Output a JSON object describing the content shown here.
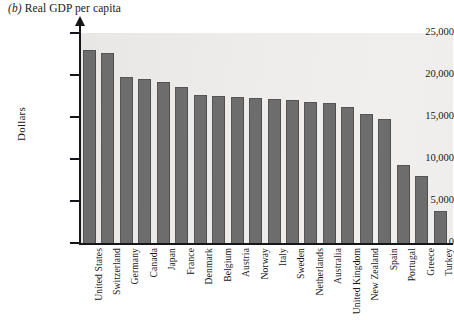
{
  "chart_data": {
    "type": "bar",
    "title": "(b) Real GDP per capita",
    "title_prefix": "(b)",
    "title_text": "Real GDP per capita",
    "xlabel": "",
    "ylabel": "Dollars",
    "ylim": [
      0,
      25000
    ],
    "ytick_labels": [
      "25,000",
      "20,000",
      "15,000",
      "10,000",
      "5,000",
      "0"
    ],
    "ytick_values": [
      25000,
      20000,
      15000,
      10000,
      5000,
      0
    ],
    "grid": false,
    "legend": null,
    "bar_color": "#6d6d6d",
    "plot_background": "#efedeb",
    "categories": [
      "United States",
      "Switzerland",
      "Germany",
      "Canada",
      "Japan",
      "France",
      "Denmark",
      "Belgium",
      "Austria",
      "Norway",
      "Italy",
      "Sweden",
      "Netherlands",
      "Australia",
      "United Kingdom",
      "New Zealand",
      "Spain",
      "Portugal",
      "Greece",
      "Turkey"
    ],
    "values": [
      22850,
      22450,
      19600,
      19400,
      19100,
      18400,
      17500,
      17400,
      17300,
      17100,
      17000,
      16950,
      16700,
      16500,
      16100,
      15200,
      14600,
      9200,
      7800,
      3700
    ]
  }
}
